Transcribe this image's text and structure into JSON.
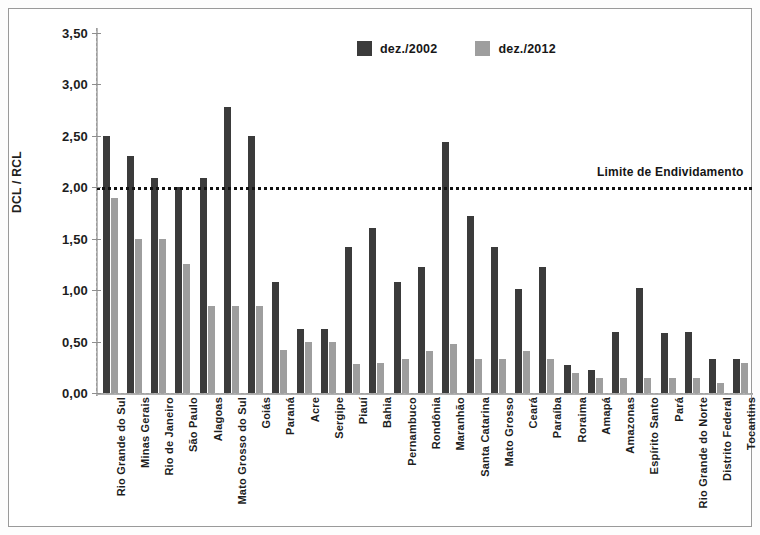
{
  "chart_data": {
    "type": "bar",
    "title": "",
    "subtitle": "",
    "xlabel": "",
    "ylabel": "DCL / RCL",
    "ylim": [
      0.0,
      3.5
    ],
    "ytick_step": 0.5,
    "ytick_labels": [
      "0,00",
      "0,50",
      "1,00",
      "1,50",
      "2,00",
      "2,50",
      "3,00",
      "3,50"
    ],
    "ytick_values": [
      0.0,
      0.5,
      1.0,
      1.5,
      2.0,
      2.5,
      3.0,
      3.5
    ],
    "grid": false,
    "legend_position": "top-center",
    "categories": [
      "Rio Grande do Sul",
      "Minas Gerais",
      "Rio de Janeiro",
      "São Paulo",
      "Alagoas",
      "Mato Grosso do Sul",
      "Goiás",
      "Paraná",
      "Acre",
      "Sergipe",
      "Piauí",
      "Bahia",
      "Pernambuco",
      "Rondônia",
      "Maranhão",
      "Santa Catarina",
      "Mato Grosso",
      "Ceará",
      "Paraíba",
      "Roraima",
      "Amapá",
      "Amazonas",
      "Espírito Santo",
      "Pará",
      "Rio Grande do Norte",
      "Distrito Federal",
      "Tocantins"
    ],
    "series": [
      {
        "name": "dez./2002",
        "color": "#3b3b3b",
        "values": [
          2.5,
          2.3,
          2.09,
          2.0,
          2.09,
          2.78,
          2.5,
          1.08,
          0.62,
          0.62,
          1.42,
          1.6,
          1.08,
          1.23,
          2.44,
          1.72,
          1.42,
          1.01,
          1.23,
          0.27,
          0.22,
          0.59,
          1.02,
          0.58,
          0.59,
          0.33,
          0.33
        ]
      },
      {
        "name": "dez./2012",
        "color": "#9e9e9e",
        "values": [
          1.9,
          1.5,
          1.5,
          1.25,
          0.85,
          0.85,
          0.85,
          0.42,
          0.5,
          0.5,
          0.28,
          0.29,
          0.33,
          0.41,
          0.48,
          0.33,
          0.33,
          0.41,
          0.33,
          0.19,
          0.15,
          0.15,
          0.15,
          0.15,
          0.15,
          0.1,
          0.29
        ]
      }
    ],
    "annotations": [
      {
        "label": "Limite de Endividamento",
        "value": 2.0,
        "style": "dotted-horizontal-line",
        "color": "#111111"
      }
    ]
  }
}
